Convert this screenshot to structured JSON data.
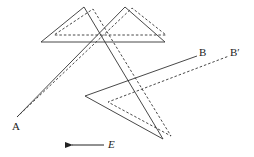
{
  "diagram": {
    "labels": {
      "start": "A",
      "end_solid": "B",
      "end_dashed": "B′",
      "field": "E"
    },
    "paths": {
      "solid": "17,117 125,7 165,42 41,42 84,7 163,139 85,96 197,56",
      "dashed": "17,117 132,8 166,35 54,35 93,9 171,136 108,102 229,56"
    },
    "colors": {
      "line": "#333333",
      "background": "#ffffff"
    },
    "field_arrow": {
      "direction": "left"
    }
  }
}
